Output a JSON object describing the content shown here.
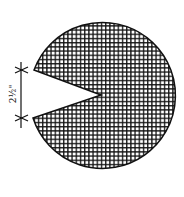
{
  "diagram": {
    "title": "",
    "shape": "circle-with-v-notch",
    "fill_pattern": "crosshatch",
    "colors": {
      "stroke": "#111111",
      "background": "#ffffff"
    },
    "circle": {
      "cx": 105,
      "cy": 97,
      "r": 73
    },
    "notch": {
      "tip": [
        101,
        95
      ],
      "upper_edge": [
        34,
        70
      ],
      "lower_edge": [
        33,
        118
      ]
    },
    "dimension": {
      "label": "2½\"",
      "orientation": "vertical",
      "x": 21,
      "y_start": 70,
      "y_end": 118
    }
  }
}
